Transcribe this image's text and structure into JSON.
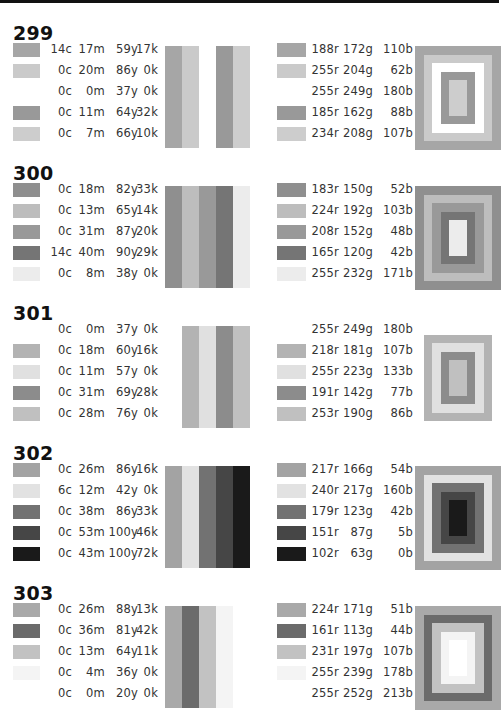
{
  "sections": [
    {
      "title": "299",
      "rows": [
        {
          "c": "14c",
          "m": "17m",
          "y": "59y",
          "k": "17k",
          "r": "188r",
          "g": "172g",
          "b": "110b",
          "gray": "#a6a6a6"
        },
        {
          "c": "0c",
          "m": "20m",
          "y": "86y",
          "k": "0k",
          "r": "255r",
          "g": "204g",
          "b": "62b",
          "gray": "#cacaca"
        },
        {
          "c": "0c",
          "m": "0m",
          "y": "37y",
          "k": "0k",
          "r": "255r",
          "g": "249g",
          "b": "180b",
          "gray": "#ffffff"
        },
        {
          "c": "0c",
          "m": "11m",
          "y": "64y",
          "k": "32k",
          "r": "185r",
          "g": "162g",
          "b": "88b",
          "gray": "#999999"
        },
        {
          "c": "0c",
          "m": "7m",
          "y": "66y",
          "k": "10k",
          "r": "234r",
          "g": "208g",
          "b": "107b",
          "gray": "#cdcdcd"
        }
      ]
    },
    {
      "title": "300",
      "rows": [
        {
          "c": "0c",
          "m": "18m",
          "y": "82y",
          "k": "33k",
          "r": "183r",
          "g": "150g",
          "b": "52b",
          "gray": "#8f8f8f"
        },
        {
          "c": "0c",
          "m": "13m",
          "y": "65y",
          "k": "14k",
          "r": "224r",
          "g": "192g",
          "b": "103b",
          "gray": "#bdbdbd"
        },
        {
          "c": "0c",
          "m": "31m",
          "y": "87y",
          "k": "20k",
          "r": "208r",
          "g": "152g",
          "b": "48b",
          "gray": "#999999"
        },
        {
          "c": "14c",
          "m": "40m",
          "y": "90y",
          "k": "29k",
          "r": "165r",
          "g": "120g",
          "b": "42b",
          "gray": "#757575"
        },
        {
          "c": "0c",
          "m": "8m",
          "y": "38y",
          "k": "0k",
          "r": "255r",
          "g": "232g",
          "b": "171b",
          "gray": "#ececec"
        }
      ]
    },
    {
      "title": "301",
      "rows": [
        {
          "c": "0c",
          "m": "0m",
          "y": "37y",
          "k": "0k",
          "r": "255r",
          "g": "249g",
          "b": "180b",
          "gray": "#ffffff"
        },
        {
          "c": "0c",
          "m": "18m",
          "y": "60y",
          "k": "16k",
          "r": "218r",
          "g": "181g",
          "b": "107b",
          "gray": "#b3b3b3"
        },
        {
          "c": "0c",
          "m": "11m",
          "y": "57y",
          "k": "0k",
          "r": "255r",
          "g": "223g",
          "b": "133b",
          "gray": "#e0e0e0"
        },
        {
          "c": "0c",
          "m": "31m",
          "y": "69y",
          "k": "28k",
          "r": "191r",
          "g": "142g",
          "b": "77b",
          "gray": "#8c8c8c"
        },
        {
          "c": "0c",
          "m": "28m",
          "y": "76y",
          "k": "0k",
          "r": "253r",
          "g": "190g",
          "b": "86b",
          "gray": "#c0c0c0"
        }
      ]
    },
    {
      "title": "302",
      "rows": [
        {
          "c": "0c",
          "m": "26m",
          "y": "86y",
          "k": "16k",
          "r": "217r",
          "g": "166g",
          "b": "54b",
          "gray": "#a3a3a3"
        },
        {
          "c": "6c",
          "m": "12m",
          "y": "42y",
          "k": "0k",
          "r": "240r",
          "g": "217g",
          "b": "160b",
          "gray": "#e2e2e2"
        },
        {
          "c": "0c",
          "m": "38m",
          "y": "86y",
          "k": "33k",
          "r": "179r",
          "g": "123g",
          "b": "42b",
          "gray": "#727272"
        },
        {
          "c": "0c",
          "m": "53m",
          "y": "100y",
          "k": "46k",
          "r": "151r",
          "g": "87g",
          "b": "5b",
          "gray": "#464646"
        },
        {
          "c": "0c",
          "m": "43m",
          "y": "100y",
          "k": "72k",
          "r": "102r",
          "g": "63g",
          "b": "0b",
          "gray": "#1a1a1a"
        }
      ]
    },
    {
      "title": "303",
      "rows": [
        {
          "c": "0c",
          "m": "26m",
          "y": "88y",
          "k": "13k",
          "r": "224r",
          "g": "171g",
          "b": "51b",
          "gray": "#a9a9a9"
        },
        {
          "c": "0c",
          "m": "36m",
          "y": "81y",
          "k": "42k",
          "r": "161r",
          "g": "113g",
          "b": "44b",
          "gray": "#6b6b6b"
        },
        {
          "c": "0c",
          "m": "13m",
          "y": "64y",
          "k": "11k",
          "r": "231r",
          "g": "197g",
          "b": "107b",
          "gray": "#c2c2c2"
        },
        {
          "c": "0c",
          "m": "4m",
          "y": "36y",
          "k": "0k",
          "r": "255r",
          "g": "239g",
          "b": "178b",
          "gray": "#f4f4f4"
        },
        {
          "c": "0c",
          "m": "0m",
          "y": "20y",
          "k": "0k",
          "r": "255r",
          "g": "252g",
          "b": "213b",
          "gray": "#ffffff"
        }
      ]
    }
  ]
}
